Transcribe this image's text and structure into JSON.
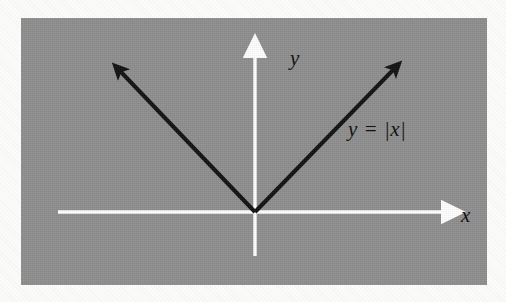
{
  "figure": {
    "kind": "math-graph-figure",
    "background_color": "#fbfbfa",
    "panel": {
      "fill_color": "#8e8e8e",
      "x": 21,
      "y": 18,
      "width": 466,
      "height": 267
    },
    "axis_color": "#ffffff",
    "curve_color": "#111111",
    "label_color": "#141414"
  },
  "labels": {
    "y_axis": "y",
    "x_axis": "x",
    "curve": "y = |x|"
  },
  "chart_data": {
    "type": "line",
    "title": "",
    "subtitle": "",
    "xlabel": "x",
    "ylabel": "y",
    "annotations": [
      {
        "text": "y = |x|",
        "x": 0.62,
        "y": 0.62,
        "placement": "right-branch"
      }
    ],
    "legend": [],
    "legend_position": "none",
    "grid": false,
    "xlim": [
      -1.05,
      1.05
    ],
    "ylim": [
      -0.28,
      1.05
    ],
    "axes": {
      "x_axis": {
        "drawn_from": -0.84,
        "drawn_to": 0.84,
        "arrow_at": "positive-end",
        "tick_labels": [],
        "color": "#ffffff"
      },
      "y_axis": {
        "drawn_from": -0.27,
        "drawn_to": 1.0,
        "arrow_at": "positive-end",
        "tick_labels": [],
        "color": "#ffffff"
      }
    },
    "series": [
      {
        "name": "y = |x|",
        "equation": "y = |x|",
        "color": "#111111",
        "line_width_px": 4,
        "arrow_start": true,
        "arrow_end": true,
        "x": [
          -0.72,
          0.0,
          0.72
        ],
        "values": [
          0.72,
          0.0,
          0.72
        ],
        "points": [
          {
            "x": -0.72,
            "y": 0.72
          },
          {
            "x": 0.0,
            "y": 0.0
          },
          {
            "x": 0.72,
            "y": 0.72
          }
        ]
      }
    ]
  }
}
